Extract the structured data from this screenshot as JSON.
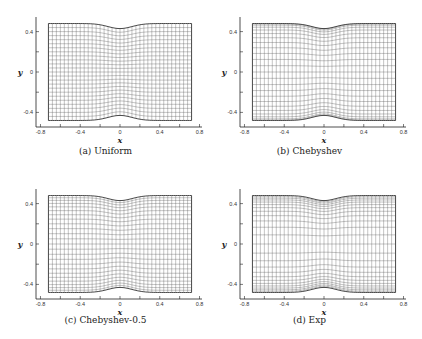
{
  "chart_data": [
    {
      "type": "grid-mesh",
      "label": "(a) Uniform",
      "xlabel": "x",
      "ylabel": "y",
      "xticks": [
        -0.8,
        -0.4,
        0,
        0.4,
        0.8
      ],
      "yticks": [
        0.4,
        0,
        -0.4
      ],
      "xtick_labels": [
        "-0.8",
        "-0.4",
        "0",
        "0.4",
        "0.8"
      ],
      "ytick_labels": [
        "0.4",
        "0",
        "-0.4"
      ],
      "xlim": [
        -0.8,
        0.8
      ],
      "ylim": [
        -0.5,
        0.55
      ],
      "domain_x": [
        -0.72,
        0.72
      ],
      "domain_y": [
        -0.48,
        0.48
      ],
      "bump_depth": 0.05,
      "nx": 36,
      "ny": 24,
      "y_spacing": "uniform"
    },
    {
      "type": "grid-mesh",
      "label": "(b) Chebyshev",
      "xlabel": "x",
      "ylabel": "y",
      "xticks": [
        -0.8,
        -0.4,
        0,
        0.4,
        0.8
      ],
      "yticks": [
        0.4,
        0,
        -0.4
      ],
      "xtick_labels": [
        "-0.8",
        "-0.4",
        "0",
        "0.4",
        "0.8"
      ],
      "ytick_labels": [
        "0.4",
        "0",
        "-0.4"
      ],
      "xlim": [
        -0.8,
        0.8
      ],
      "ylim": [
        -0.5,
        0.55
      ],
      "domain_x": [
        -0.72,
        0.72
      ],
      "domain_y": [
        -0.48,
        0.48
      ],
      "bump_depth": 0.05,
      "nx": 36,
      "ny": 24,
      "y_spacing": "chebyshev"
    },
    {
      "type": "grid-mesh",
      "label": "(c) Chebyshev-0.5",
      "xlabel": "x",
      "ylabel": "y",
      "xticks": [
        -0.8,
        -0.4,
        0,
        0.4,
        0.8
      ],
      "yticks": [
        0.4,
        0,
        -0.4
      ],
      "xtick_labels": [
        "-0.8",
        "-0.4",
        "0",
        "0.4",
        "0.8"
      ],
      "ytick_labels": [
        "0.4",
        "0",
        "-0.4"
      ],
      "xlim": [
        -0.8,
        0.8
      ],
      "ylim": [
        -0.5,
        0.55
      ],
      "domain_x": [
        -0.72,
        0.72
      ],
      "domain_y": [
        -0.48,
        0.48
      ],
      "bump_depth": 0.05,
      "nx": 36,
      "ny": 24,
      "y_spacing": "chebyshev-0.5"
    },
    {
      "type": "grid-mesh",
      "label": "(d) Exp",
      "xlabel": "x",
      "ylabel": "y",
      "xticks": [
        -0.8,
        -0.4,
        0,
        0.4,
        0.8
      ],
      "yticks": [
        0.4,
        0,
        -0.4
      ],
      "xtick_labels": [
        "-0.8",
        "-0.4",
        "0",
        "0.4",
        "0.8"
      ],
      "ytick_labels": [
        "0.4",
        "0",
        "-0.4"
      ],
      "xlim": [
        -0.8,
        0.8
      ],
      "ylim": [
        -0.5,
        0.55
      ],
      "domain_x": [
        -0.72,
        0.72
      ],
      "domain_y": [
        -0.48,
        0.48
      ],
      "bump_depth": 0.05,
      "nx": 36,
      "ny": 24,
      "y_spacing": "exp"
    }
  ],
  "captions": [
    "(a) Uniform",
    "(b) Chebyshev",
    "(c) Chebyshev-0.5",
    "(d) Exp"
  ],
  "axis": {
    "x_title": "x",
    "y_title": "y"
  },
  "colors": {
    "grid": "#555555",
    "axis": "#222222",
    "boundary": "#333333"
  }
}
